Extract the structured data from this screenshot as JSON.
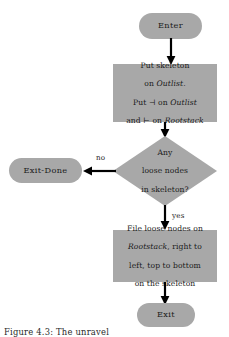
{
  "figure": {
    "type": "flowchart",
    "caption": "Figure 4.3:  The unravel",
    "colors": {
      "node_fill": "#a8a8a8",
      "stroke": "#000000",
      "text": "#1a1a1a",
      "background": "#ffffff"
    }
  },
  "nodes": {
    "enter": {
      "shape": "terminator",
      "label": "Enter"
    },
    "init": {
      "shape": "process",
      "lines": [
        {
          "text": "Put skeleton"
        },
        {
          "pre": "on ",
          "italic": "Outlist",
          "post": "."
        },
        {
          "pre": "Put ",
          "symbol": "⊣",
          "post": " on ",
          "italic": "Outlist"
        },
        {
          "pre": "and ",
          "symbol": "⊢",
          "post": " on ",
          "italic": "Rootstack"
        }
      ],
      "plain": "Put skeleton\non Outlist.\nPut ⊣ on Outlist\nand ⊢ on Rootstack"
    },
    "decision": {
      "shape": "diamond",
      "lines": [
        "Any",
        "loose nodes",
        "in skeleton?"
      ],
      "plain": "Any\nloose nodes\nin skeleton?"
    },
    "exit_done": {
      "shape": "terminator",
      "label": "Exit-Done"
    },
    "file": {
      "shape": "process",
      "lines": [
        {
          "text": "File loose nodes on"
        },
        {
          "italic": "Rootstack",
          "post": ", right to"
        },
        {
          "text": "left, top to bottom"
        },
        {
          "text": "on the skeleton"
        }
      ],
      "plain": "File loose nodes on\nRootstack, right to\nleft, top to bottom\non the skeleton"
    },
    "exit": {
      "shape": "terminator",
      "label": "Exit"
    }
  },
  "edges": [
    {
      "from": "enter",
      "to": "init",
      "label": "",
      "direction": "down"
    },
    {
      "from": "init",
      "to": "decision",
      "label": "",
      "direction": "down"
    },
    {
      "from": "decision",
      "to": "exit_done",
      "label": "no",
      "direction": "left"
    },
    {
      "from": "decision",
      "to": "file",
      "label": "yes",
      "direction": "down"
    },
    {
      "from": "file",
      "to": "exit",
      "label": "",
      "direction": "down"
    }
  ]
}
